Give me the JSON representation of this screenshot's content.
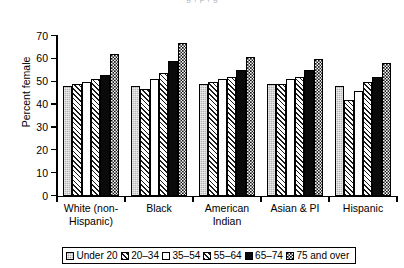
{
  "figure": {
    "cropped_title_fragment": "g        ,           p       ,          g",
    "y_axis_title": "Percent female"
  },
  "legend": {
    "position": "bottom",
    "entries": [
      {
        "label": "Under 20",
        "swatch": "light-gray-solid-swatch"
      },
      {
        "label": "20–34",
        "swatch": "diagonal-hatch-swatch"
      },
      {
        "label": "35–54",
        "swatch": "white-solid-swatch"
      },
      {
        "label": "55–64",
        "swatch": "diagonal-hatch-swatch"
      },
      {
        "label": "65–74",
        "swatch": "black-solid-swatch"
      },
      {
        "label": "75 and over",
        "swatch": "checkerboard-swatch"
      }
    ]
  },
  "chart_data": {
    "type": "bar",
    "title": "",
    "xlabel": "",
    "ylabel": "Percent female",
    "ylim": [
      0,
      70
    ],
    "yticks": [
      0,
      10,
      20,
      30,
      40,
      50,
      60,
      70
    ],
    "ytick_labels": [
      "0",
      "10",
      "20",
      "30",
      "40",
      "50",
      "60",
      "70"
    ],
    "grid": false,
    "legend_position": "bottom",
    "categories": [
      "White (non-Hispanic)",
      "Black",
      "American Indian",
      "Asian & PI",
      "Hispanic"
    ],
    "category_label_lines": [
      [
        "White (non-",
        "Hispanic)"
      ],
      [
        "Black"
      ],
      [
        "American",
        "Indian"
      ],
      [
        "Asian & PI"
      ],
      [
        "Hispanic"
      ]
    ],
    "series": [
      {
        "name": "Under 20",
        "values": [
          48,
          48,
          49,
          49,
          48
        ]
      },
      {
        "name": "20–34",
        "values": [
          49,
          47,
          50,
          49,
          42
        ]
      },
      {
        "name": "35–54",
        "values": [
          50,
          51,
          51,
          51,
          46
        ]
      },
      {
        "name": "55–64",
        "values": [
          51,
          54,
          52,
          52,
          50
        ]
      },
      {
        "name": "65–74",
        "values": [
          53,
          59,
          55,
          55,
          52
        ]
      },
      {
        "name": "75 and over",
        "values": [
          62,
          67,
          61,
          60,
          58
        ]
      }
    ]
  }
}
